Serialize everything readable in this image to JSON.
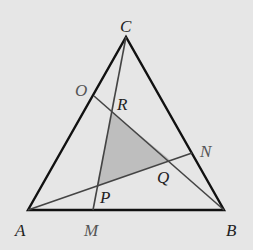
{
  "diagram": {
    "type": "geometry",
    "background": "#e6e6e6",
    "shade_color": "#b4b4b4",
    "points": {
      "A": {
        "label": "A",
        "x": 28,
        "y": 210
      },
      "B": {
        "label": "B",
        "x": 224,
        "y": 210
      },
      "C": {
        "label": "C",
        "x": 126,
        "y": 37
      },
      "M": {
        "label": "M",
        "x": 93,
        "y": 210
      },
      "N": {
        "label": "N",
        "x": 192,
        "y": 153
      },
      "O": {
        "label": "O",
        "x": 94,
        "y": 96
      },
      "P": {
        "label": "P",
        "x": 97,
        "y": 186
      },
      "Q": {
        "label": "Q",
        "x": 170,
        "y": 160
      },
      "R": {
        "label": "R",
        "x": 112,
        "y": 112
      }
    },
    "triangle": [
      "A",
      "B",
      "C"
    ],
    "cevians": [
      [
        "C",
        "M"
      ],
      [
        "A",
        "N"
      ],
      [
        "B",
        "O"
      ]
    ],
    "shaded_region": [
      "P",
      "Q",
      "R"
    ]
  }
}
